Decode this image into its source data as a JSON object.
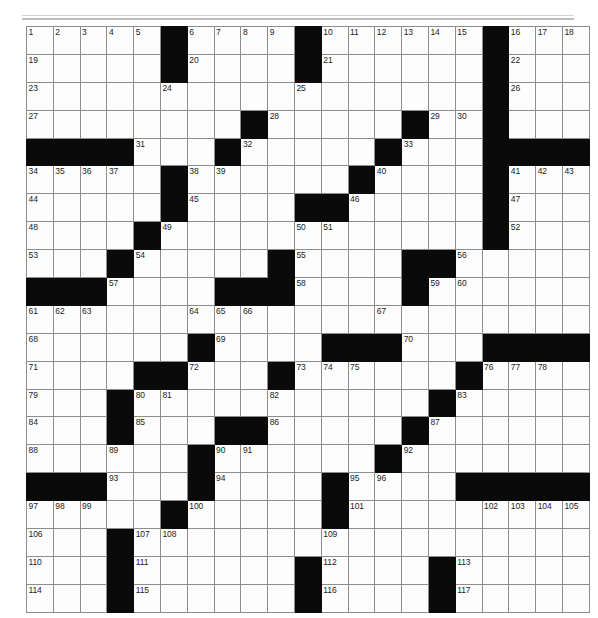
{
  "puzzle": {
    "title": "Crossword Puzzle Grid",
    "kind": "crossword-grid",
    "rows": 21,
    "cols": 21,
    "colors": {
      "block": "#0a0a0a",
      "cell": "#fdfdfd",
      "gridline": "#8d8d90",
      "border": "#59595b",
      "number_text": "#1c1c1c",
      "page_background": "#ffffff"
    },
    "clue_number_count": 117,
    "clue_numbers_min": 1,
    "clue_numbers_max": 117,
    "grid": [
      {
        "row": 1,
        "blocks": [
          6,
          11,
          18
        ],
        "numbers": {
          "1": 1,
          "2": 2,
          "3": 3,
          "4": 4,
          "5": 5,
          "7": 6,
          "8": 7,
          "9": 8,
          "10": 9,
          "12": 10,
          "13": 11,
          "14": 12,
          "15": 13,
          "16": 14,
          "17": 15,
          "19": 16,
          "20": 17,
          "21": 18
        }
      },
      {
        "row": 2,
        "blocks": [
          6,
          11,
          18
        ],
        "numbers": {
          "1": 19,
          "7": 20,
          "12": 21,
          "19": 22
        }
      },
      {
        "row": 3,
        "blocks": [
          18
        ],
        "numbers": {
          "1": 23,
          "6": 24,
          "11": 25,
          "19": 26
        }
      },
      {
        "row": 4,
        "blocks": [
          9,
          15,
          18
        ],
        "numbers": {
          "1": 27,
          "10": 28,
          "16": 29,
          "17": 30
        }
      },
      {
        "row": 5,
        "blocks": [
          1,
          2,
          3,
          4,
          8,
          14,
          18,
          19,
          20,
          21
        ],
        "numbers": {
          "5": 31,
          "9": 32,
          "15": 33
        }
      },
      {
        "row": 6,
        "blocks": [
          6,
          13,
          18
        ],
        "numbers": {
          "1": 34,
          "2": 35,
          "3": 36,
          "4": 37,
          "7": 38,
          "8": 39,
          "14": 40,
          "19": 41,
          "20": 42,
          "21": 43
        }
      },
      {
        "row": 7,
        "blocks": [
          6,
          11,
          12,
          18
        ],
        "numbers": {
          "1": 44,
          "7": 45,
          "13": 46,
          "19": 47
        }
      },
      {
        "row": 8,
        "blocks": [
          5,
          18
        ],
        "numbers": {
          "1": 48,
          "6": 49,
          "11": 50,
          "12": 51,
          "19": 52
        }
      },
      {
        "row": 9,
        "blocks": [
          4,
          10,
          15,
          16
        ],
        "numbers": {
          "1": 53,
          "5": 54,
          "11": 55,
          "17": 56
        }
      },
      {
        "row": 10,
        "blocks": [
          1,
          2,
          3,
          8,
          9,
          10,
          15
        ],
        "numbers": {
          "4": 57,
          "11": 58,
          "16": 59,
          "17": 60
        }
      },
      {
        "row": 11,
        "blocks": [],
        "numbers": {
          "1": 61,
          "2": 62,
          "3": 63,
          "7": 64,
          "8": 65,
          "9": 66,
          "14": 67
        }
      },
      {
        "row": 12,
        "blocks": [
          7,
          12,
          13,
          14,
          18,
          19,
          20,
          21
        ],
        "numbers": {
          "1": 68,
          "8": 69,
          "15": 70
        }
      },
      {
        "row": 13,
        "blocks": [
          5,
          6,
          10,
          17
        ],
        "numbers": {
          "1": 71,
          "7": 72,
          "11": 73,
          "12": 74,
          "13": 75,
          "18": 76,
          "19": 77,
          "20": 78
        }
      },
      {
        "row": 14,
        "blocks": [
          4,
          16
        ],
        "numbers": {
          "1": 79,
          "5": 80,
          "6": 81,
          "10": 82,
          "17": 83
        }
      },
      {
        "row": 15,
        "blocks": [
          4,
          8,
          9,
          15
        ],
        "numbers": {
          "1": 84,
          "5": 85,
          "10": 86,
          "16": 87
        }
      },
      {
        "row": 16,
        "blocks": [
          7,
          14
        ],
        "numbers": {
          "1": 88,
          "4": 89,
          "8": 90,
          "9": 91,
          "15": 92
        }
      },
      {
        "row": 17,
        "blocks": [
          1,
          2,
          3,
          7,
          12,
          17,
          18,
          19,
          20,
          21
        ],
        "numbers": {
          "4": 93,
          "8": 94,
          "13": 95,
          "14": 96
        }
      },
      {
        "row": 18,
        "blocks": [
          6,
          12
        ],
        "numbers": {
          "1": 97,
          "2": 98,
          "3": 99,
          "7": 100,
          "13": 101,
          "18": 102,
          "19": 103,
          "20": 104,
          "21": 105
        }
      },
      {
        "row": 19,
        "blocks": [
          4
        ],
        "numbers": {
          "1": 106,
          "5": 107,
          "6": 108,
          "12": 109
        }
      },
      {
        "row": 20,
        "blocks": [
          4,
          11,
          16
        ],
        "numbers": {
          "1": 110,
          "5": 111,
          "12": 112,
          "17": 113
        }
      },
      {
        "row": 21,
        "blocks": [
          4,
          11,
          16
        ],
        "numbers": {
          "1": 114,
          "5": 115,
          "12": 116,
          "17": 117
        }
      }
    ]
  }
}
